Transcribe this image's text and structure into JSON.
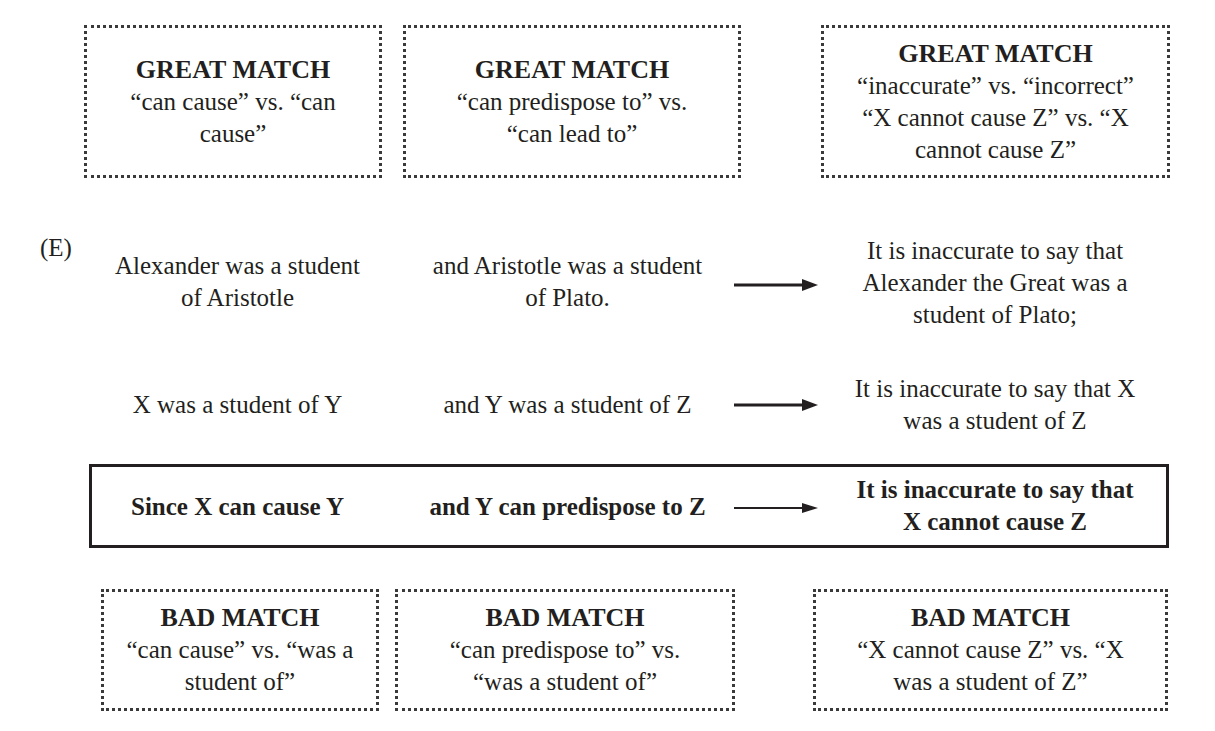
{
  "great_matches": [
    {
      "title": "GREAT MATCH",
      "lines": [
        "“can cause” vs. “can",
        "cause”"
      ]
    },
    {
      "title": "GREAT MATCH",
      "lines": [
        "“can predispose to” vs.",
        "“can lead to”"
      ]
    },
    {
      "title": "GREAT MATCH",
      "lines": [
        "“inaccurate” vs. “incorrect”",
        "“X cannot cause Z” vs. “X",
        "cannot cause Z”"
      ]
    }
  ],
  "choice_label": "(E)",
  "rows": [
    {
      "premise1": [
        "Alexander was a student",
        "of Aristotle"
      ],
      "premise2": [
        "and Aristotle was a student",
        "of Plato."
      ],
      "conclusion": [
        "It is inaccurate to say that",
        "Alexander the Great was a",
        "student of Plato;"
      ]
    },
    {
      "premise1": [
        "X was a student of Y"
      ],
      "premise2": [
        "and Y was a student of Z"
      ],
      "conclusion": [
        "It is inaccurate to say that X",
        "was a student of Z"
      ]
    }
  ],
  "summary": {
    "premise1": "Since X can cause Y",
    "premise2": "and Y can predispose to Z",
    "conclusion": [
      "It is inaccurate to say that",
      "X cannot cause Z"
    ]
  },
  "bad_matches": [
    {
      "title": "BAD MATCH",
      "lines": [
        "“can cause” vs. “was a",
        "student of”"
      ]
    },
    {
      "title": "BAD MATCH",
      "lines": [
        "“can predispose to” vs.",
        "“was a student of”"
      ]
    },
    {
      "title": "BAD MATCH",
      "lines": [
        "“X cannot cause Z” vs. “X",
        "was a student of Z”"
      ]
    }
  ],
  "icons": {
    "arrow": "right-arrow-icon"
  }
}
